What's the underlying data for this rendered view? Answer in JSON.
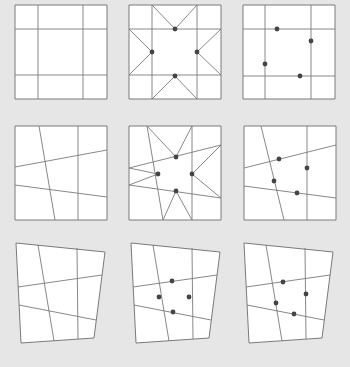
{
  "figure": {
    "rows": [
      {
        "name": "undistorted",
        "panels": [
          "grid-only",
          "grid-with-star-and-points",
          "grid-with-points"
        ]
      },
      {
        "name": "line-warped",
        "panels": [
          "grid-only",
          "grid-with-star-and-points",
          "grid-with-points"
        ]
      },
      {
        "name": "perspective-warped",
        "panels": [
          "grid-only",
          "grid-with-points",
          "grid-with-points"
        ]
      }
    ],
    "colors": {
      "background": "#e6e6e6",
      "panel_fill": "#ffffff",
      "line": "#7a7a7a",
      "point": "#444444"
    }
  }
}
